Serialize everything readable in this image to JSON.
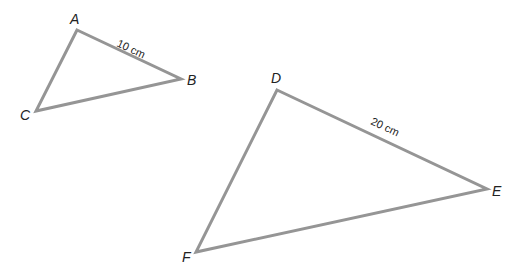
{
  "diagram": {
    "stroke_color": "#959595",
    "triangles": [
      {
        "name": "ABC",
        "vertices": {
          "A": {
            "label": "A",
            "x": 77,
            "y": 30
          },
          "B": {
            "label": "B",
            "x": 181,
            "y": 79
          },
          "C": {
            "label": "C",
            "x": 36,
            "y": 111
          }
        },
        "measurement": {
          "side": "AB",
          "label": "10 cm"
        }
      },
      {
        "name": "DEF",
        "vertices": {
          "D": {
            "label": "D",
            "x": 277,
            "y": 90
          },
          "E": {
            "label": "E",
            "x": 487,
            "y": 189
          },
          "F": {
            "label": "F",
            "x": 196,
            "y": 252
          }
        },
        "measurement": {
          "side": "DE",
          "label": "20 cm"
        }
      }
    ]
  }
}
